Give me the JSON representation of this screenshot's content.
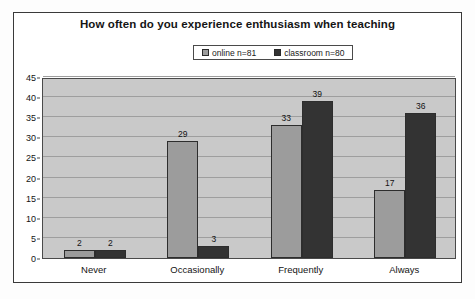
{
  "chart_data": {
    "type": "bar",
    "title": "How often do you experience enthusiasm when teaching",
    "xlabel": "",
    "ylabel": "",
    "categories": [
      "Never",
      "Occasionally",
      "Frequently",
      "Always"
    ],
    "series": [
      {
        "name": "online n=81",
        "values": [
          2,
          29,
          33,
          17
        ],
        "color": "#9c9c9c"
      },
      {
        "name": "classroom n=80",
        "values": [
          2,
          3,
          39,
          36
        ],
        "color": "#333333"
      }
    ],
    "ylim": [
      0,
      45
    ],
    "ytick_step": 5,
    "yticks": [
      0,
      5,
      10,
      15,
      20,
      25,
      30,
      35,
      40,
      45
    ],
    "grid": true,
    "data_labels": true,
    "legend_position": "top-center",
    "plot_background": "#c9c9c9",
    "gridline_color": "#9e9e9e"
  },
  "legend": {
    "entries": [
      {
        "label": "online n=81",
        "swatch": "#9c9c9c"
      },
      {
        "label": "classroom n=80",
        "swatch": "#333333"
      }
    ]
  }
}
